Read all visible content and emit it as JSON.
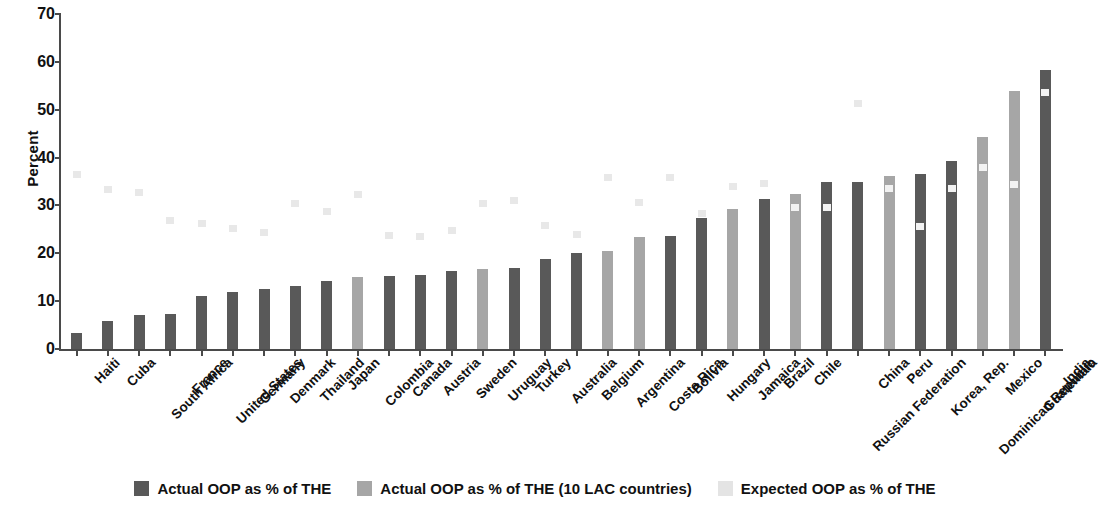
{
  "chart_data": {
    "type": "bar",
    "title": "",
    "xlabel": "",
    "ylabel": "Percent",
    "ylim": [
      0,
      70
    ],
    "yticks": [
      0,
      10,
      20,
      30,
      40,
      50,
      60,
      70
    ],
    "grid": false,
    "legend_position": "bottom",
    "categories": [
      "Haiti",
      "Cuba",
      "South Africa",
      "France",
      "United States",
      "Germany",
      "Denmark",
      "Thailand",
      "Japan",
      "Colombia",
      "Canada",
      "Austria",
      "Sweden",
      "Uruguay",
      "Turkey",
      "Australia",
      "Belgium",
      "Argentina",
      "Costa Rica",
      "Bolivia",
      "Hungary",
      "Jamaica",
      "Brazil",
      "Chile",
      "Russian Federation",
      "China",
      "Peru",
      "Korea, Rep.",
      "Dominican Republic",
      "Mexico",
      "Guatemala",
      "India"
    ],
    "series": [
      {
        "name": "Actual OOP as % of THE",
        "color": "#595959",
        "values": [
          3.4,
          5.9,
          7.2,
          7.4,
          11.1,
          12.0,
          12.6,
          13.2,
          14.2,
          null,
          15.2,
          15.4,
          16.4,
          null,
          17.0,
          18.8,
          20.1,
          null,
          null,
          23.7,
          27.4,
          null,
          31.3,
          null,
          34.8,
          34.9,
          null,
          36.6,
          39.2,
          null,
          null,
          58.4
        ]
      },
      {
        "name": "Actual OOP as % of THE (10 LAC countries)",
        "color": "#a6a6a6",
        "values": [
          null,
          null,
          null,
          null,
          null,
          null,
          null,
          null,
          null,
          15.0,
          null,
          null,
          null,
          16.7,
          null,
          null,
          null,
          20.4,
          23.5,
          null,
          null,
          29.3,
          null,
          32.4,
          null,
          null,
          36.1,
          null,
          null,
          44.4,
          54.0,
          null
        ]
      },
      {
        "name": "Expected OOP as % of THE",
        "color": "#e4e4e4",
        "values": [
          36.4,
          33.3,
          32.6,
          26.8,
          26.2,
          25.2,
          24.4,
          30.3,
          28.8,
          32.2,
          23.8,
          23.6,
          24.8,
          30.5,
          31.0,
          25.9,
          24.0,
          35.9,
          30.6,
          35.8,
          28.3,
          34.0,
          34.5,
          29.5,
          29.5,
          51.4,
          33.6,
          25.6,
          33.5,
          38.0,
          34.3,
          53.5
        ]
      }
    ]
  },
  "legend": {
    "items": [
      {
        "label": "Actual OOP as % of THE",
        "swatch": "dark"
      },
      {
        "label": "Actual OOP as % of THE (10 LAC countries)",
        "swatch": "light"
      },
      {
        "label": "Expected OOP as % of THE",
        "swatch": "faint"
      }
    ]
  },
  "axes": {
    "y_title": "Percent"
  }
}
